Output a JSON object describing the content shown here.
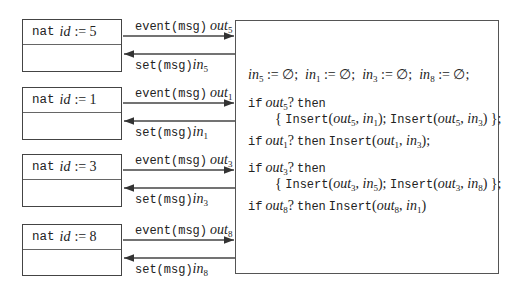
{
  "processes": [
    {
      "keyword": "nat",
      "var": "id",
      "op": ":=",
      "value": "5",
      "out_label": "event(msg)",
      "out_var": "out",
      "out_sub": "5",
      "in_label": "set(msg)",
      "in_var": "in",
      "in_sub": "5"
    },
    {
      "keyword": "nat",
      "var": "id",
      "op": ":=",
      "value": "1",
      "out_label": "event(msg)",
      "out_var": "out",
      "out_sub": "1",
      "in_label": "set(msg)",
      "in_var": "in",
      "in_sub": "1"
    },
    {
      "keyword": "nat",
      "var": "id",
      "op": ":=",
      "value": "3",
      "out_label": "event(msg)",
      "out_var": "out",
      "out_sub": "3",
      "in_label": "set(msg)",
      "in_var": "in",
      "in_sub": "3"
    },
    {
      "keyword": "nat",
      "var": "id",
      "op": ":=",
      "value": "8",
      "out_label": "event(msg)",
      "out_var": "out",
      "out_sub": "8",
      "in_label": "set(msg)",
      "in_var": "in",
      "in_sub": "8"
    }
  ],
  "code": {
    "init": [
      {
        "var": "in",
        "sub": "5",
        "rest": " := ∅;  "
      },
      {
        "var": "in",
        "sub": "1",
        "rest": " := ∅;  "
      },
      {
        "var": "in",
        "sub": "3",
        "rest": " := ∅;  "
      },
      {
        "var": "in",
        "sub": "8",
        "rest": " := ∅;"
      }
    ],
    "kw_if": "if",
    "kw_then": "then",
    "fn_insert": "Insert",
    "q": "?",
    "out": "out",
    "in": "in",
    "rules": [
      {
        "cond": "5",
        "pairs": [
          [
            "5",
            "1"
          ],
          [
            "5",
            "3"
          ]
        ],
        "multiline": true,
        "terminator": ";"
      },
      {
        "cond": "1",
        "pairs": [
          [
            "1",
            "3"
          ]
        ],
        "multiline": false,
        "terminator": ";"
      },
      {
        "cond": "3",
        "pairs": [
          [
            "3",
            "5"
          ],
          [
            "3",
            "8"
          ]
        ],
        "multiline": true,
        "terminator": ";"
      },
      {
        "cond": "8",
        "pairs": [
          [
            "8",
            "1"
          ]
        ],
        "multiline": false,
        "terminator": ""
      }
    ]
  },
  "colors": {
    "line": "#444444",
    "text": "#222222",
    "background": "#ffffff"
  }
}
